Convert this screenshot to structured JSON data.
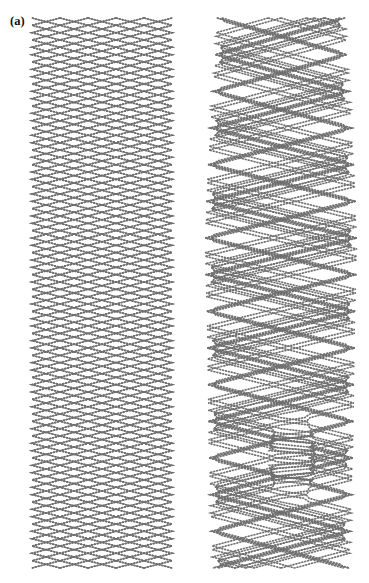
{
  "figure": {
    "caption_labels": {
      "a": "(a)",
      "b": "(b)"
    },
    "running_head": "",
    "wire_color": "#6e6e6e",
    "background_color": "#ffffff",
    "stroke_width": 1.6,
    "bead_pitch": 3.0,
    "panels": [
      {
        "id": "a",
        "label": "(a)",
        "description": "undeformed uniform braided stent mesh",
        "x": 32,
        "y": 18,
        "width": 140,
        "height": 550,
        "wire_pairs": 10,
        "rows": 15,
        "cell_height": 36.6,
        "cell_width": 14.0,
        "profile": [
          {
            "t": 0.0,
            "half_width": 70
          },
          {
            "t": 0.5,
            "half_width": 70
          },
          {
            "t": 1.0,
            "half_width": 70
          }
        ]
      },
      {
        "id": "b",
        "label": "(b)",
        "description": "deformed braided stent mesh with irregular cell openings",
        "x": 207,
        "y": 18,
        "width": 148,
        "height": 550,
        "wire_pairs": 10,
        "rows": 15,
        "cell_height": 36.6,
        "cell_width": 14.8,
        "profile": [
          {
            "t": 0.0,
            "half_width": 64
          },
          {
            "t": 0.08,
            "half_width": 66
          },
          {
            "t": 0.18,
            "half_width": 70
          },
          {
            "t": 0.3,
            "half_width": 74
          },
          {
            "t": 0.42,
            "half_width": 76
          },
          {
            "t": 0.55,
            "half_width": 74
          },
          {
            "t": 0.68,
            "half_width": 73
          },
          {
            "t": 0.8,
            "half_width": 72
          },
          {
            "t": 0.9,
            "half_width": 70
          },
          {
            "t": 1.0,
            "half_width": 68
          }
        ],
        "phase_shift": [
          0.0,
          0.42,
          0.55,
          0.08,
          0.02,
          0.0,
          0.05,
          0.5,
          0.62,
          0.12
        ],
        "open_cell": {
          "cx": 0.58,
          "cy": 0.8,
          "rx": 0.09,
          "ry": 0.1
        }
      }
    ]
  }
}
